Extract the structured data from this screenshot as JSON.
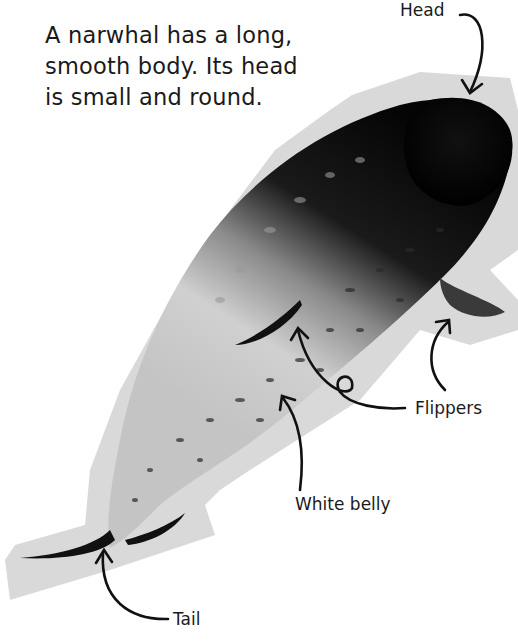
{
  "page": {
    "intro_lines": [
      "A narwhal has a long,",
      "smooth body. Its head",
      "is small and round."
    ],
    "labels": {
      "head": "Head",
      "flippers": "Flippers",
      "white_belly": "White belly",
      "tail": "Tail"
    },
    "colors": {
      "background": "#ffffff",
      "cutout_shadow": "#d6d6d6",
      "text": "#1a1a1a",
      "body_dark": "#0d0d0d",
      "body_light": "#cfcfcf"
    }
  }
}
